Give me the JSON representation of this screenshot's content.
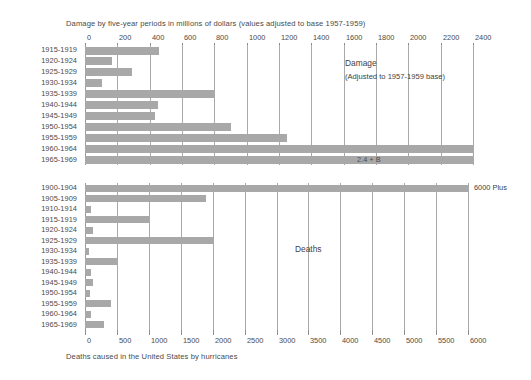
{
  "figure": {
    "top_caption": "Damage by five-year periods in millions of dollars (values adjusted to base 1957-1959)",
    "bottom_caption": "Deaths caused in the United States by hurricanes",
    "bar_color": "#a8a8a8",
    "grid_color": "#a9a9a9",
    "text_color": "#4a4a4a"
  },
  "damage_panel": {
    "legend_title": "Damage",
    "legend_subtitle": "(Adjusted to 1957-1959 base)",
    "bar_annotation": "2.4 + B"
  },
  "deaths_panel": {
    "legend_title": "Deaths",
    "bar_annotation": "6000 Plus"
  },
  "chart_data": [
    {
      "type": "bar",
      "orientation": "horizontal",
      "title": "Damage",
      "subtitle": "(Adjusted to 1957-1959 base)",
      "xlabel": "Damage by five-year periods in millions of dollars (values adjusted to base 1957-1959)",
      "ylabel": "",
      "xlim": [
        0,
        2400
      ],
      "xticks": [
        0,
        200,
        400,
        600,
        800,
        1000,
        1200,
        1400,
        1600,
        1800,
        2000,
        2200,
        2400
      ],
      "xticklabels": [
        "0",
        "200",
        "400",
        "600",
        "800",
        "1000",
        "1200",
        "1400",
        "1600",
        "1800",
        "2000",
        "2200",
        "2400"
      ],
      "axis_position": "top",
      "grid": true,
      "legend": "none",
      "categories": [
        "1915-1919",
        "1920-1924",
        "1925-1929",
        "1930-1934",
        "1935-1939",
        "1940-1944",
        "1945-1949",
        "1950-1954",
        "1955-1959",
        "1960-1964",
        "1965-1969"
      ],
      "values": [
        460,
        170,
        290,
        105,
        800,
        450,
        430,
        900,
        1250,
        2400,
        2400
      ],
      "annotations": [
        {
          "category": "1965-1969",
          "text": "2.4 + B",
          "note": "bar exceeds axis maximum"
        }
      ]
    },
    {
      "type": "bar",
      "orientation": "horizontal",
      "title": "Deaths",
      "subtitle": "",
      "xlabel": "Deaths caused in the United States by hurricanes",
      "ylabel": "",
      "xlim": [
        0,
        6000
      ],
      "xticks": [
        0,
        500,
        1000,
        1500,
        2000,
        2500,
        3000,
        3500,
        4000,
        4500,
        5000,
        5500,
        6000
      ],
      "xticklabels": [
        "0",
        "500",
        "1000",
        "1500",
        "2000",
        "2500",
        "3000",
        "3500",
        "4000",
        "4500",
        "5000",
        "5500",
        "6000"
      ],
      "axis_position": "bottom",
      "grid": true,
      "legend": "none",
      "categories": [
        "1900-1904",
        "1905-1909",
        "1910-1914",
        "1915-1919",
        "1920-1924",
        "1925-1929",
        "1930-1934",
        "1935-1939",
        "1940-1944",
        "1945-1949",
        "1950-1954",
        "1955-1959",
        "1960-1964",
        "1965-1969"
      ],
      "values": [
        6000,
        1900,
        100,
        1000,
        120,
        2000,
        60,
        500,
        100,
        120,
        80,
        400,
        90,
        300
      ],
      "annotations": [
        {
          "category": "1900-1904",
          "text": "6000 Plus",
          "note": "bar exceeds axis maximum"
        }
      ]
    }
  ]
}
